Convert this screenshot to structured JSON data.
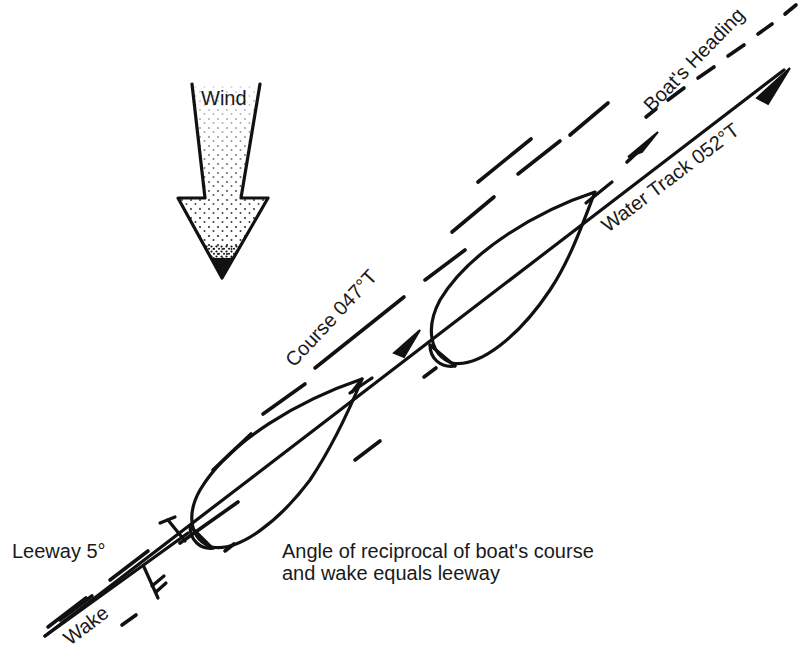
{
  "diagram": {
    "type": "leeway-navigation-diagram",
    "labels": {
      "wind": "Wind",
      "boats_heading": "Boat's Heading",
      "water_track": "Water Track 052°T",
      "course": "Course 047°T",
      "leeway": "Leeway 5°",
      "wake": "Wake",
      "caption_line1": "Angle of reciprocal of boat's course",
      "caption_line2": "and wake equals leeway"
    },
    "values": {
      "course_bearing": "047°T",
      "water_track_bearing": "052°T",
      "leeway_angle": "5°"
    },
    "elements": {
      "wind_arrow": {
        "direction": "down",
        "fill": "stippled"
      },
      "boats": [
        {
          "position": "lower-left"
        },
        {
          "position": "upper-right"
        }
      ]
    },
    "colors": {
      "ink": "#111111",
      "background": "#ffffff"
    }
  }
}
